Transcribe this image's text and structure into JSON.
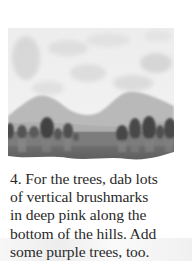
{
  "illustration": {
    "subject": "watercolor landscape: cloudy sky, hills, row of trees, meadow",
    "colors": {
      "sky": "#ececec",
      "cloud_shadow": "#d6d6d6",
      "hills": "#b8b8b8",
      "trees": "#4a4a4a",
      "tree_trunks": "#7a7a7a",
      "meadow": "#6e6e6e"
    }
  },
  "caption": {
    "step_number": "4.",
    "lines": [
      "4. For the trees, dab lots",
      "of vertical brushmarks",
      "in deep pink along the",
      "bottom of the hills. Add",
      "some purple trees, too."
    ]
  }
}
